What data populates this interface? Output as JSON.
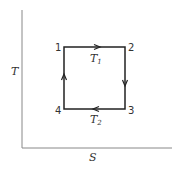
{
  "diagram": {
    "type": "T-S diagram (Carnot cycle)",
    "axes": {
      "x_label": "S",
      "y_label": "T"
    },
    "states": [
      {
        "id": "1",
        "label": "1"
      },
      {
        "id": "2",
        "label": "2"
      },
      {
        "id": "3",
        "label": "3"
      },
      {
        "id": "4",
        "label": "4"
      }
    ],
    "isotherms": {
      "top": {
        "symbol": "T",
        "subscript": "1"
      },
      "bottom": {
        "symbol": "T",
        "subscript": "2"
      }
    },
    "colors": {
      "axis": "#888888",
      "cycle": "#222222",
      "text": "#333333"
    }
  }
}
